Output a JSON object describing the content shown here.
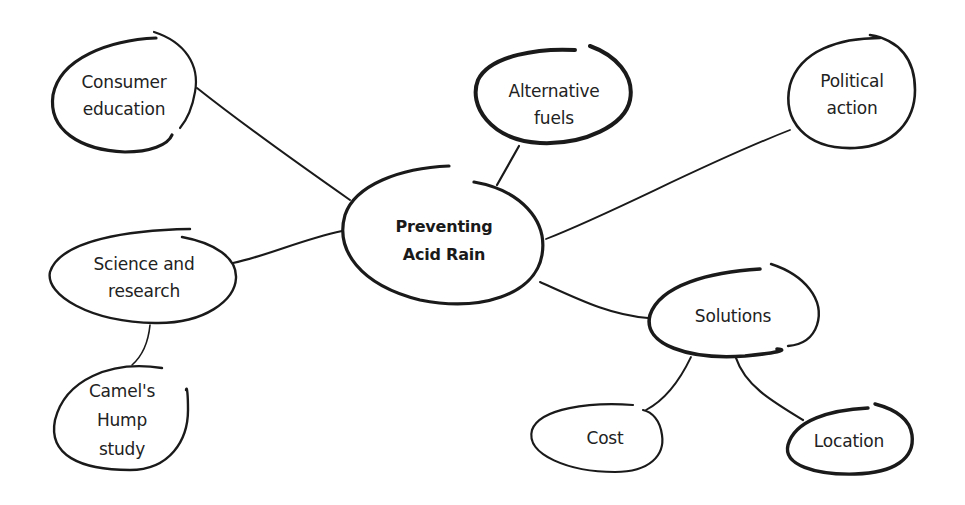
{
  "diagram": {
    "type": "mind-map",
    "central": {
      "id": "central",
      "lines": [
        "Preventing",
        "Acid Rain"
      ]
    },
    "nodes": [
      {
        "id": "consumer-education",
        "lines": [
          "Consumer",
          "education"
        ],
        "parent": "central"
      },
      {
        "id": "alternative-fuels",
        "lines": [
          "Alternative",
          "fuels"
        ],
        "parent": "central"
      },
      {
        "id": "political-action",
        "lines": [
          "Political",
          "action"
        ],
        "parent": "central"
      },
      {
        "id": "science-and-research",
        "lines": [
          "Science and",
          "research"
        ],
        "parent": "central"
      },
      {
        "id": "camels-hump-study",
        "lines": [
          "Camel's",
          "Hump",
          "study"
        ],
        "parent": "science-and-research"
      },
      {
        "id": "solutions",
        "lines": [
          "Solutions"
        ],
        "parent": "central"
      },
      {
        "id": "cost",
        "lines": [
          "Cost"
        ],
        "parent": "solutions"
      },
      {
        "id": "location",
        "lines": [
          "Location"
        ],
        "parent": "solutions"
      }
    ],
    "colors": {
      "stroke": "#1a1a1a",
      "text": "#222222",
      "background": "#ffffff"
    }
  }
}
